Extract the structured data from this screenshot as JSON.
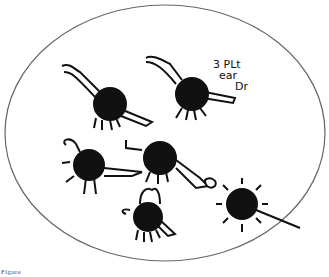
{
  "drawing": {
    "annotation": {
      "line1": "3 PLt",
      "line2": "ear",
      "line3": "Dr"
    },
    "caption": "Figure",
    "figures": [
      {
        "id": "figure-1",
        "label": "spotted body with arm raised"
      },
      {
        "id": "figure-2",
        "label": "body with arm raised and legs"
      },
      {
        "id": "figure-3",
        "label": "body with claws and jagged tail"
      },
      {
        "id": "figure-4",
        "label": "central body with long arm"
      },
      {
        "id": "figure-5",
        "label": "body with head loop"
      },
      {
        "id": "figure-6",
        "label": "spiky body"
      }
    ],
    "colors": {
      "ink": "#111111",
      "outline": "#666666",
      "background": "#ffffff"
    }
  }
}
